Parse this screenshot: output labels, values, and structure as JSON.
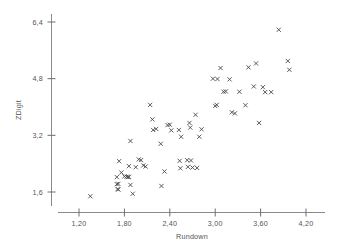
{
  "chart_data": {
    "type": "scatter",
    "title": "",
    "xlabel": "Rundown",
    "ylabel": "ZDigit",
    "marker": "x",
    "marker_color": "#4a4a4a",
    "grid": false,
    "legend": null,
    "xlim": [
      1.02,
      4.38
    ],
    "ylim": [
      1.25,
      6.62
    ],
    "xticks": [
      1.2,
      1.8,
      2.4,
      3.0,
      3.6,
      4.2
    ],
    "xticklabels": [
      "1,20",
      "1,80",
      "2,40",
      "3,00",
      "3,60",
      "4,20"
    ],
    "yticks": [
      1.6,
      3.2,
      4.8,
      6.4
    ],
    "yticklabels": [
      "1,6",
      "3,2",
      "4,8",
      "6,4"
    ],
    "points": [
      [
        1.35,
        1.48
      ],
      [
        1.7,
        2.02
      ],
      [
        1.7,
        1.82
      ],
      [
        1.72,
        1.83
      ],
      [
        1.71,
        1.68
      ],
      [
        1.72,
        1.67
      ],
      [
        1.73,
        2.47
      ],
      [
        1.76,
        2.15
      ],
      [
        1.8,
        2.04
      ],
      [
        1.83,
        2.03
      ],
      [
        1.85,
        2.02
      ],
      [
        1.86,
        2.03
      ],
      [
        1.88,
        3.04
      ],
      [
        1.86,
        2.33
      ],
      [
        1.88,
        1.8
      ],
      [
        1.91,
        1.55
      ],
      [
        1.95,
        2.3
      ],
      [
        1.99,
        2.52
      ],
      [
        2.02,
        2.5
      ],
      [
        2.05,
        2.35
      ],
      [
        2.08,
        2.32
      ],
      [
        2.14,
        4.06
      ],
      [
        2.17,
        3.65
      ],
      [
        2.18,
        3.35
      ],
      [
        2.22,
        3.38
      ],
      [
        2.28,
        2.96
      ],
      [
        2.29,
        1.77
      ],
      [
        2.33,
        2.18
      ],
      [
        2.37,
        3.49
      ],
      [
        2.4,
        3.5
      ],
      [
        2.42,
        3.34
      ],
      [
        2.52,
        3.35
      ],
      [
        2.53,
        2.48
      ],
      [
        2.54,
        2.27
      ],
      [
        2.55,
        3.16
      ],
      [
        2.63,
        2.5
      ],
      [
        2.64,
        2.31
      ],
      [
        2.66,
        3.55
      ],
      [
        2.67,
        3.42
      ],
      [
        2.68,
        2.49
      ],
      [
        2.7,
        2.29
      ],
      [
        2.74,
        3.78
      ],
      [
        2.76,
        2.28
      ],
      [
        2.79,
        3.16
      ],
      [
        2.82,
        3.37
      ],
      [
        2.97,
        4.8
      ],
      [
        3.0,
        4.03
      ],
      [
        3.02,
        4.06
      ],
      [
        3.03,
        4.79
      ],
      [
        3.07,
        5.1
      ],
      [
        3.11,
        4.43
      ],
      [
        3.14,
        4.44
      ],
      [
        3.19,
        4.78
      ],
      [
        3.22,
        3.85
      ],
      [
        3.26,
        3.82
      ],
      [
        3.32,
        4.43
      ],
      [
        3.4,
        4.05
      ],
      [
        3.44,
        5.12
      ],
      [
        3.51,
        4.58
      ],
      [
        3.54,
        5.23
      ],
      [
        3.58,
        3.55
      ],
      [
        3.63,
        4.56
      ],
      [
        3.66,
        4.42
      ],
      [
        3.74,
        4.42
      ],
      [
        3.84,
        6.18
      ],
      [
        3.96,
        5.3
      ],
      [
        3.98,
        5.05
      ]
    ]
  }
}
